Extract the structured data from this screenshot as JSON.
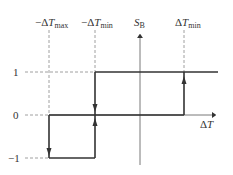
{
  "diagram": {
    "type": "hysteresis-step-function",
    "top_labels": [
      {
        "id": "neg_dtmax",
        "prefix": "−Δ",
        "var": "T",
        "sub": "max"
      },
      {
        "id": "neg_dtmin",
        "prefix": "−Δ",
        "var": "T",
        "sub": "min"
      },
      {
        "id": "sb",
        "prefix": "",
        "var": "S",
        "sub": "B"
      },
      {
        "id": "dtmin",
        "prefix": "Δ",
        "var": "T",
        "sub": "min"
      }
    ],
    "y_ticks": [
      "1",
      "0",
      "−1"
    ],
    "x_axis_label": {
      "prefix": "Δ",
      "var": "T"
    },
    "y_axis_label": {
      "var": "S",
      "sub": "B"
    },
    "colors": {
      "line": "#333333",
      "dash": "#888888",
      "text": "#333333"
    }
  }
}
